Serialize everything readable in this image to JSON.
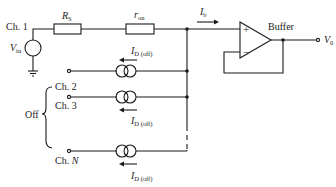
{
  "diagram": {
    "channels": {
      "ch1": "Ch. 1",
      "ch2": "Ch. 2",
      "ch3": "Ch. 3",
      "chN_prefix": "Ch. ",
      "chN_var": "N",
      "off_group": "Off"
    },
    "components": {
      "source": {
        "var": "V",
        "sub": "in"
      },
      "rs": {
        "var": "R",
        "sub": "S"
      },
      "ron": {
        "var": "r",
        "sub": "on"
      },
      "buffer_label": "Buffer",
      "plus": "+",
      "minus": "−"
    },
    "currents": {
      "ib": {
        "var": "I",
        "sub": "b"
      },
      "leak_var": "I",
      "leak_sub": "D (off)"
    },
    "output": {
      "var": "V",
      "sub": "0"
    }
  }
}
